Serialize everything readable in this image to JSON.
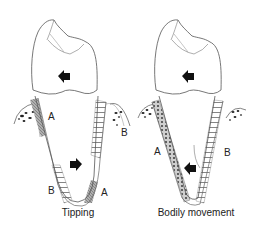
{
  "figure": {
    "panels": [
      {
        "id": "tipping",
        "caption": "Tipping",
        "labels": {
          "upper_left": "A",
          "upper_right": "B",
          "lower_left": "B",
          "lower_right": "A"
        },
        "crown_arrow_direction": "left",
        "root_arrow_direction": "right"
      },
      {
        "id": "bodily",
        "caption": "Bodily movement",
        "labels": {
          "left": "A",
          "right": "B"
        },
        "crown_arrow_direction": "left",
        "root_arrow_direction": "left"
      }
    ],
    "colors": {
      "line": "#555555",
      "compression_fill": "#9a9a9a",
      "tension_hatch": "#777777",
      "arrow": "#111111",
      "bone_dots": "#222222"
    }
  }
}
